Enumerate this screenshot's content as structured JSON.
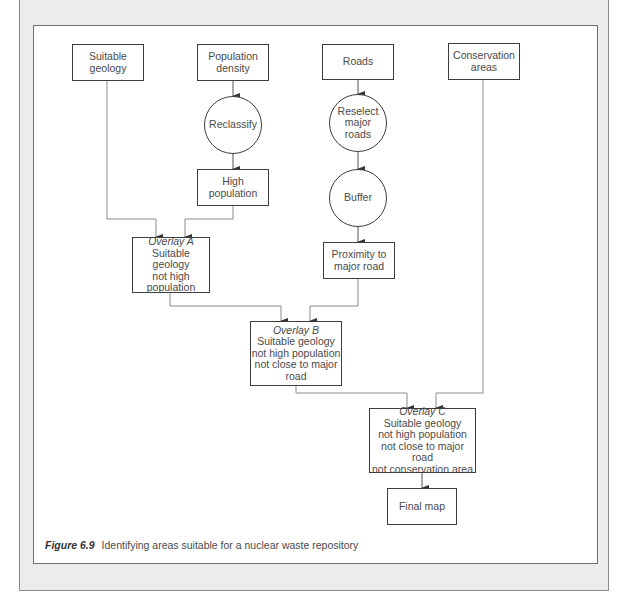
{
  "figure": {
    "label": "Figure 6.9",
    "caption": "Identifying areas suitable for a nuclear waste repository"
  },
  "nodes": {
    "suitable_geology": {
      "lines": [
        "Suitable",
        "geology"
      ],
      "shape": "rect"
    },
    "population_density": {
      "lines": [
        "Population",
        "density"
      ],
      "shape": "rect"
    },
    "roads": {
      "lines": [
        "Roads"
      ],
      "shape": "rect"
    },
    "conservation_areas": {
      "lines": [
        "Conservation",
        "areas"
      ],
      "shape": "rect"
    },
    "reclassify": {
      "lines": [
        "Reclassify"
      ],
      "shape": "circle"
    },
    "reselect_major_roads": {
      "lines": [
        "Reselect",
        "major",
        "roads"
      ],
      "shape": "circle"
    },
    "buffer": {
      "lines": [
        "Buffer"
      ],
      "shape": "circle"
    },
    "high_population": {
      "lines": [
        "High",
        "population"
      ],
      "shape": "rect"
    },
    "proximity_to_major_road": {
      "lines": [
        "Proximity to",
        "major road"
      ],
      "shape": "rect"
    },
    "overlay_a": {
      "title": "Overlay A",
      "lines": [
        "Suitable geology",
        "not high",
        "population"
      ],
      "shape": "rect"
    },
    "overlay_b": {
      "title": "Overlay B",
      "lines": [
        "Suitable geology",
        "not high population",
        "not close to major",
        "road"
      ],
      "shape": "rect"
    },
    "overlay_c": {
      "title": "Overlay C",
      "lines": [
        "Suitable geology",
        "not high population",
        "not close to major road",
        "not conservation area"
      ],
      "shape": "rect"
    },
    "final_map": {
      "lines": [
        "Final map"
      ],
      "shape": "rect"
    }
  },
  "edges": [
    [
      "population_density",
      "reclassify"
    ],
    [
      "reclassify",
      "high_population"
    ],
    [
      "roads",
      "reselect_major_roads"
    ],
    [
      "reselect_major_roads",
      "buffer"
    ],
    [
      "buffer",
      "proximity_to_major_road"
    ],
    [
      "suitable_geology",
      "overlay_a"
    ],
    [
      "high_population",
      "overlay_a"
    ],
    [
      "overlay_a",
      "overlay_b"
    ],
    [
      "proximity_to_major_road",
      "overlay_b"
    ],
    [
      "overlay_b",
      "overlay_c"
    ],
    [
      "conservation_areas",
      "overlay_c"
    ],
    [
      "overlay_c",
      "final_map"
    ]
  ],
  "colors": {
    "box_border": "#3c3c3c",
    "connector": "#8c8c8c",
    "text": "#4a4a4a",
    "panel_bg": "#ececec"
  }
}
